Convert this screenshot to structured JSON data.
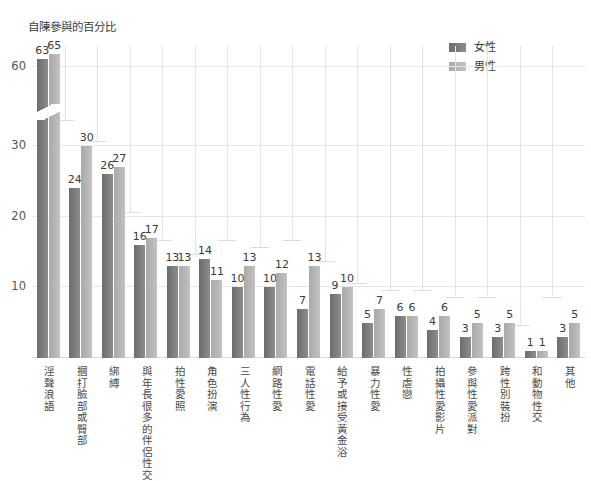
{
  "top_title": "",
  "axis_title": "自陳參與的百分比",
  "legend": {
    "position": "top-right",
    "items": [
      {
        "label": "女性",
        "color": "#7b7b7b"
      },
      {
        "label": "男性",
        "color": "#b4b4b4"
      }
    ]
  },
  "y_axis": {
    "ticks": [
      "10",
      "20",
      "30",
      "60"
    ],
    "tick_values": [
      10,
      20,
      30,
      60
    ],
    "broken_axis": true,
    "break_between": [
      30,
      60
    ]
  },
  "chart_data": {
    "type": "bar",
    "title": "自陳參與的百分比",
    "xlabel": "",
    "ylabel": "自陳參與的百分比",
    "ylim": [
      0,
      65
    ],
    "grid": true,
    "legend_position": "top-right",
    "broken_axis": true,
    "categories": [
      "淫聲浪語",
      "摑打臉部或臀部",
      "綁縛",
      "與年長很多的伴侶性交",
      "拍性愛照",
      "角色扮演",
      "三人性行為",
      "網路性愛",
      "電話性愛",
      "給予或接受黃金浴",
      "暴力性愛",
      "性虐戀",
      "拍攝性愛影片",
      "參與性愛派對",
      "跨性別裝扮",
      "和動物性交",
      "其他"
    ],
    "series": [
      {
        "name": "女性",
        "color": "#7b7b7b",
        "values": [
          63,
          24,
          26,
          16,
          13,
          14,
          10,
          10,
          7,
          9,
          5,
          6,
          4,
          3,
          3,
          1,
          3
        ]
      },
      {
        "name": "男性",
        "color": "#b4b4b4",
        "values": [
          65,
          30,
          27,
          17,
          13,
          11,
          13,
          12,
          13,
          10,
          7,
          6,
          6,
          5,
          5,
          1,
          5
        ]
      }
    ]
  }
}
